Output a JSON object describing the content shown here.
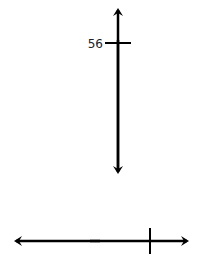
{
  "diagram": {
    "type": "number-lines",
    "colors": {
      "line": "#000000",
      "label": "#222222",
      "background": "#ffffff"
    },
    "vertical_number_line": {
      "orientation": "vertical",
      "arrows": "both-ends",
      "ticks": [
        {
          "label": "56",
          "position": "upper"
        }
      ]
    },
    "horizontal_number_line": {
      "orientation": "horizontal",
      "arrows": "both-ends",
      "ticks": [
        {
          "label": "",
          "position": "right"
        }
      ]
    }
  }
}
